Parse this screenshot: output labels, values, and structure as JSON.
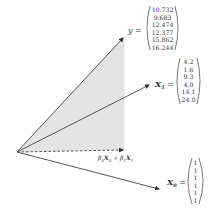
{
  "diagram": {
    "title": "",
    "colors": {
      "line": "#555555",
      "shade": "#e4e4e4",
      "text": "#333333"
    },
    "vectors": {
      "y": {
        "label": "y",
        "equals": "=",
        "values": [
          "10.732",
          "9.683",
          "12.474",
          "12.377",
          "15.862",
          "16.244"
        ]
      },
      "x1": {
        "label": "X",
        "subscript": "1",
        "equals": "=",
        "values": [
          "4.2",
          "1.6",
          "9.3",
          "4.0",
          "14.1",
          "24.0"
        ]
      },
      "x0": {
        "label": "X",
        "subscript": "0",
        "equals": "=",
        "values": [
          "1",
          "1",
          "1",
          "1",
          "1",
          "1"
        ]
      }
    },
    "projection": {
      "beta0": "β",
      "beta0_sub": "0",
      "x0": "X",
      "x0_sub": "0",
      "plus": " + ",
      "beta1": "β",
      "beta1_sub": "1",
      "x1": "X",
      "x1_sub": "1"
    }
  }
}
